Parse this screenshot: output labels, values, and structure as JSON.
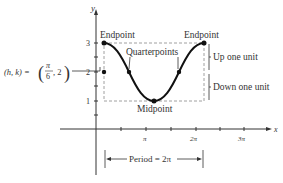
{
  "diagram": {
    "y_axis_label": "y",
    "x_axis_label": "x",
    "y_ticks": [
      "1",
      "2",
      "3"
    ],
    "x_ticks": [
      "π",
      "2π",
      "3π"
    ],
    "annotations": {
      "endpoint_left": "Endpoint",
      "endpoint_right": "Endpoint",
      "quarterpoints": "Quarterpoints",
      "midpoint": "Midpoint",
      "up": "Up one unit",
      "down": "Down one unit",
      "center": "(h, k) = ",
      "center_num": "π",
      "center_den": "6",
      "center_k": ", 2",
      "period": "Period = 2π"
    },
    "colors": {
      "curve": "#111111",
      "text": "#333333",
      "dashed": "#777777"
    }
  }
}
